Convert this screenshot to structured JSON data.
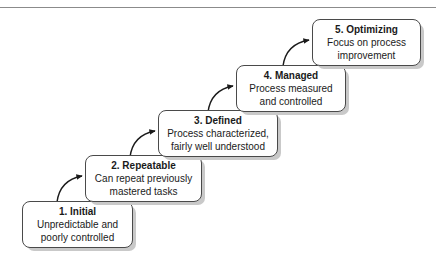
{
  "diagram": {
    "background_color": "#ffffff",
    "box_border_color": "#4a4a4a",
    "box_fill_color": "#ffffff",
    "shadow_color": "#c9c9c9",
    "arrow_color": "#1a1a1a",
    "rule_color": "#8b8b8b"
  },
  "stages": [
    {
      "title": "1. Initial",
      "desc_line1": "Unpredictable and",
      "desc_line2": "poorly controlled"
    },
    {
      "title": "2. Repeatable",
      "desc_line1": "Can repeat previously",
      "desc_line2": "mastered tasks"
    },
    {
      "title": "3. Defined",
      "desc_line1": "Process characterized,",
      "desc_line2": "fairly well understood"
    },
    {
      "title": "4. Managed",
      "desc_line1": "Process measured",
      "desc_line2": "and controlled"
    },
    {
      "title": "5. Optimizing",
      "desc_line1": "Focus on process",
      "desc_line2": "improvement"
    }
  ]
}
